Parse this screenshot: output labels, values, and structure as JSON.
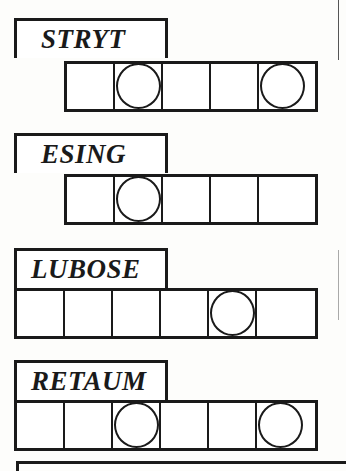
{
  "puzzles": [
    {
      "scrambled": "STRYT",
      "letters": 5,
      "circled": [
        2,
        5
      ]
    },
    {
      "scrambled": "ESING",
      "letters": 5,
      "circled": [
        2
      ]
    },
    {
      "scrambled": "LUBOSE",
      "letters": 6,
      "circled": [
        5
      ]
    },
    {
      "scrambled": "RETAUM",
      "letters": 6,
      "circled": [
        3,
        6
      ]
    }
  ],
  "colors": {
    "ink": "#1a1a1a",
    "paper": "#fdfdfb"
  }
}
